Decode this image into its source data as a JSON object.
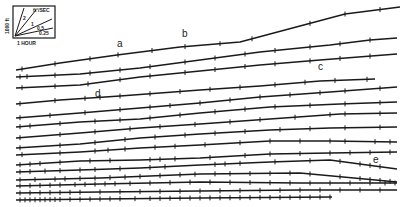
{
  "figure": {
    "type": "seismic-style trace record",
    "labels": [
      {
        "text": "a",
        "x": 117,
        "y": 47
      },
      {
        "text": "b",
        "x": 182,
        "y": 37
      },
      {
        "text": "c",
        "x": 318,
        "y": 70
      },
      {
        "text": "d",
        "x": 95,
        "y": 97
      },
      {
        "text": "e",
        "x": 373,
        "y": 163
      }
    ],
    "inset": {
      "y_label": "1000 ft",
      "x_label": "1 HOUR",
      "speed_label": "ft²/SEC",
      "ray_labels": [
        "2",
        "1",
        "0.5",
        "0.25"
      ]
    }
  },
  "chart_data": {
    "type": "line",
    "title": "",
    "xlabel": "1 HOUR",
    "ylabel": "1000 ft",
    "series": [
      {
        "name": "trace-1",
        "points": [
          [
            16,
            70
          ],
          [
            60,
            63
          ],
          [
            117,
            55
          ],
          [
            180,
            47
          ],
          [
            240,
            42
          ],
          [
            300,
            26
          ],
          [
            345,
            14
          ],
          [
            400,
            7
          ]
        ],
        "ticks": [
          22,
          55,
          90,
          118,
          152,
          185,
          220,
          252,
          310,
          345,
          380
        ]
      },
      {
        "name": "trace-2",
        "points": [
          [
            16,
            77
          ],
          [
            80,
            74
          ],
          [
            140,
            68
          ],
          [
            200,
            60
          ],
          [
            260,
            52
          ],
          [
            330,
            45
          ],
          [
            370,
            40
          ],
          [
            397,
            38
          ]
        ],
        "ticks": [
          20,
          27,
          55,
          90,
          120,
          150,
          185,
          215,
          245,
          275,
          310,
          340,
          370
        ]
      },
      {
        "name": "trace-3",
        "points": [
          [
            16,
            88
          ],
          [
            80,
            85
          ],
          [
            140,
            77
          ],
          [
            200,
            71
          ],
          [
            260,
            65
          ],
          [
            320,
            60
          ],
          [
            397,
            54
          ]
        ],
        "ticks": [
          22,
          55,
          88,
          120,
          150,
          185,
          215,
          245,
          275,
          310,
          340,
          370
        ]
      },
      {
        "name": "trace-4",
        "points": [
          [
            16,
            104
          ],
          [
            60,
            100
          ],
          [
            120,
            96
          ],
          [
            200,
            90
          ],
          [
            260,
            86
          ],
          [
            320,
            81
          ],
          [
            375,
            79
          ]
        ],
        "ticks": [
          20,
          55,
          85,
          100,
          120,
          150,
          180,
          210,
          240,
          275,
          305,
          335,
          367
        ]
      },
      {
        "name": "trace-5",
        "points": [
          [
            16,
            118
          ],
          [
            80,
            113
          ],
          [
            140,
            108
          ],
          [
            200,
            103
          ],
          [
            260,
            97
          ],
          [
            330,
            92
          ],
          [
            397,
            87
          ]
        ],
        "ticks": [
          20,
          50,
          85,
          120,
          150,
          170,
          200,
          230,
          260,
          290,
          320,
          345,
          380
        ]
      },
      {
        "name": "trace-6",
        "points": [
          [
            16,
            127
          ],
          [
            80,
            122
          ],
          [
            140,
            119
          ],
          [
            200,
            113
          ],
          [
            270,
            107
          ],
          [
            340,
            104
          ],
          [
            397,
            102
          ]
        ],
        "ticks": [
          20,
          30,
          60,
          95,
          120,
          150,
          180,
          215,
          245,
          275,
          310,
          345,
          380
        ]
      },
      {
        "name": "trace-7",
        "points": [
          [
            16,
            138
          ],
          [
            80,
            133
          ],
          [
            140,
            128
          ],
          [
            200,
            124
          ],
          [
            270,
            119
          ],
          [
            340,
            114
          ],
          [
            397,
            113
          ]
        ],
        "ticks": [
          20,
          60,
          95,
          130,
          160,
          195,
          230,
          260,
          295,
          330,
          345,
          380
        ]
      },
      {
        "name": "trace-8",
        "points": [
          [
            16,
            148
          ],
          [
            80,
            144
          ],
          [
            140,
            138
          ],
          [
            200,
            134
          ],
          [
            270,
            130
          ],
          [
            330,
            128
          ],
          [
            397,
            127
          ]
        ],
        "ticks": [
          20,
          60,
          95,
          125,
          155,
          185,
          215,
          245,
          280,
          310,
          345,
          380
        ]
      },
      {
        "name": "trace-9",
        "points": [
          [
            16,
            155
          ],
          [
            80,
            152
          ],
          [
            140,
            148
          ],
          [
            200,
            145
          ],
          [
            270,
            141
          ],
          [
            330,
            141
          ],
          [
            397,
            142
          ]
        ],
        "ticks": [
          22,
          60,
          95,
          108,
          125,
          155,
          175,
          205,
          240,
          270,
          300,
          330,
          345,
          375,
          390
        ]
      },
      {
        "name": "trace-10",
        "points": [
          [
            16,
            165
          ],
          [
            80,
            161
          ],
          [
            140,
            160
          ],
          [
            200,
            158
          ],
          [
            270,
            154
          ],
          [
            330,
            153
          ],
          [
            397,
            152
          ]
        ],
        "ticks": [
          20,
          30,
          40,
          60,
          90,
          110,
          150,
          160,
          175,
          210,
          245,
          270,
          300,
          330,
          350,
          370,
          390
        ]
      },
      {
        "name": "trace-11",
        "points": [
          [
            16,
            172
          ],
          [
            80,
            170
          ],
          [
            140,
            168
          ],
          [
            200,
            165
          ],
          [
            270,
            162
          ],
          [
            330,
            160
          ],
          [
            397,
            169
          ]
        ],
        "ticks": [
          20,
          30,
          45,
          60,
          80,
          95,
          120,
          150,
          165,
          215,
          225,
          240,
          275,
          310,
          340,
          360,
          370,
          380
        ]
      },
      {
        "name": "trace-12",
        "points": [
          [
            16,
            180
          ],
          [
            100,
            178
          ],
          [
            200,
            174
          ],
          [
            300,
            173
          ],
          [
            397,
            182
          ]
        ],
        "ticks": [
          20,
          35,
          55,
          65,
          80,
          95,
          110,
          125,
          140,
          160,
          180,
          195,
          215,
          230,
          250,
          270,
          290,
          310,
          340,
          360,
          370,
          380,
          390
        ]
      },
      {
        "name": "trace-13",
        "points": [
          [
            16,
            186
          ],
          [
            100,
            184
          ],
          [
            200,
            182
          ],
          [
            300,
            183
          ],
          [
            397,
            183
          ]
        ],
        "ticks": [
          20,
          30,
          40,
          50,
          60,
          75,
          85,
          95,
          105,
          115,
          130,
          150,
          170,
          190,
          210,
          230,
          250,
          270,
          290,
          310,
          330,
          350,
          370,
          385,
          395
        ]
      },
      {
        "name": "trace-14",
        "points": [
          [
            16,
            193
          ],
          [
            100,
            192
          ],
          [
            200,
            191
          ],
          [
            300,
            190
          ],
          [
            397,
            190
          ]
        ],
        "ticks": [
          20,
          30,
          40,
          50,
          60,
          70,
          80,
          100,
          120,
          140,
          160,
          180,
          200,
          220,
          240,
          260,
          280,
          300,
          320,
          340,
          360,
          380
        ]
      },
      {
        "name": "trace-15",
        "points": [
          [
            16,
            200
          ],
          [
            100,
            199
          ],
          [
            200,
            198
          ],
          [
            332,
            197
          ]
        ],
        "ticks": [
          20,
          25,
          30,
          35,
          40,
          45,
          50,
          55,
          60,
          70,
          80,
          90,
          100,
          110,
          120,
          135,
          150,
          160,
          170,
          180,
          190,
          200,
          210,
          220,
          230,
          240,
          250,
          260,
          270,
          280,
          290,
          300,
          310,
          320,
          330
        ]
      }
    ]
  }
}
